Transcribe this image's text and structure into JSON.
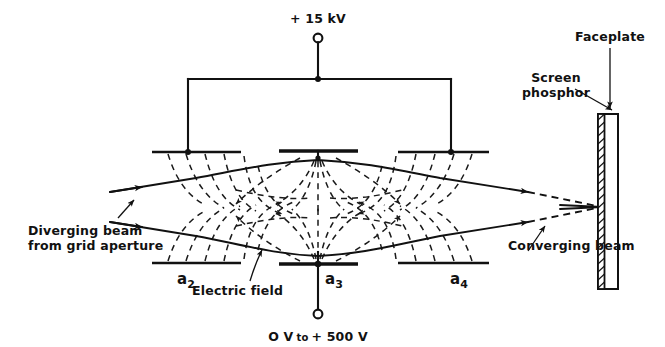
{
  "figure": {
    "type": "diagram",
    "background_color": "#ffffff",
    "ink_color": "#111111"
  },
  "supplies": {
    "top": {
      "label": "+ 15 kV",
      "terminal_name": "high-voltage-terminal",
      "connects_to": [
        "a2",
        "a4"
      ]
    },
    "bottom": {
      "label_prefix": "O V",
      "label_mid": "to",
      "label_suffix": "+ 500 V",
      "label_full": "O V to + 500 V",
      "terminal_name": "focus-voltage-terminal",
      "connects_to": [
        "a3"
      ]
    }
  },
  "electrodes": [
    {
      "id": "a2",
      "base": "a",
      "sub": "2",
      "label": "a2"
    },
    {
      "id": "a3",
      "base": "a",
      "sub": "3",
      "label": "a3"
    },
    {
      "id": "a4",
      "base": "a",
      "sub": "4",
      "label": "a4"
    }
  ],
  "annotations": {
    "diverging_beam": {
      "line1": "Diverging beam",
      "line2": "from grid aperture"
    },
    "electric_field": {
      "text": "Electric field"
    },
    "converging_beam": {
      "text": "Converging beam"
    },
    "screen_phosphor": {
      "line1": "Screen",
      "line2": "phosphor"
    },
    "faceplate": {
      "text": "Faceplate"
    }
  },
  "screen": {
    "faceplate_name": "faceplate-glass",
    "phosphor_name": "screen-phosphor-layer",
    "focus_point_name": "beam-focus-spot"
  }
}
